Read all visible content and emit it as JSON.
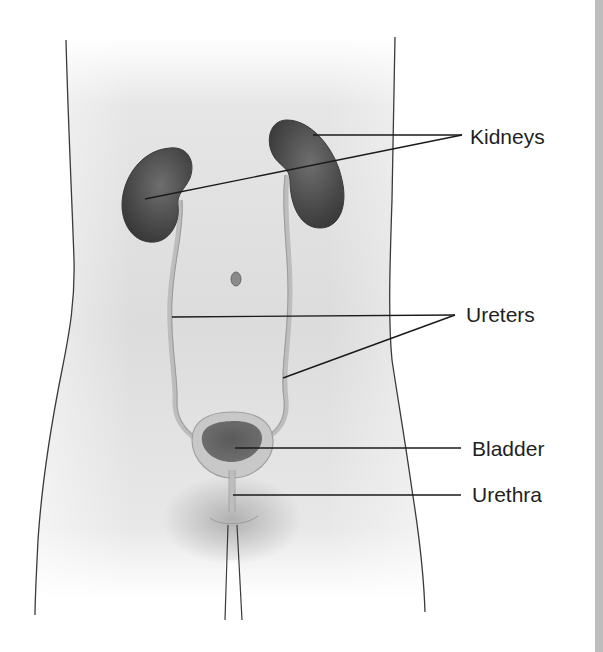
{
  "figure": {
    "labels": [
      {
        "id": "kidneys",
        "text": "Kidneys",
        "x": 470,
        "y": 126
      },
      {
        "id": "ureters",
        "text": "Ureters",
        "x": 466,
        "y": 304
      },
      {
        "id": "bladder",
        "text": "Bladder",
        "x": 472,
        "y": 438
      },
      {
        "id": "urethra",
        "text": "Urethra",
        "x": 472,
        "y": 484
      }
    ],
    "colors": {
      "skin": "#d9d9d9",
      "organ": "#4a4a4a",
      "outline": "#3a3a3a",
      "leader": "#1a1a1a",
      "edge_bar": "#bdbdbd"
    }
  }
}
